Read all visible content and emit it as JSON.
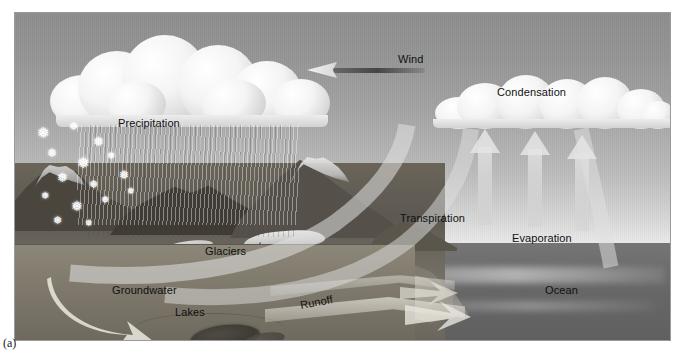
{
  "figure": {
    "caption": "(a)",
    "type": "science-diagram"
  },
  "scene": {
    "sky_color": "#a3a3a3",
    "ocean_color": "#6a6a6a",
    "land_color": "#6e6a60",
    "underground_color": "#837e70"
  },
  "labels": {
    "wind": "Wind",
    "precipitation": "Precipitation",
    "condensation": "Condensation",
    "transpiration": "Transpiration",
    "evaporation": "Evaporation",
    "ocean": "Ocean",
    "glaciers": "Glaciers",
    "groundwater": "Groundwater",
    "lakes": "Lakes",
    "runoff": "Runoff"
  },
  "elements": {
    "precipitation_cloud": "cumulus-cloud-with-rain",
    "condensation_cloud": "cumulus-cloud",
    "rain_streaks": "rain-fall",
    "snowflakes": "snow-fall",
    "wind_arrow_direction": "left",
    "evaporation_arrows_count": 3,
    "evaporation_arrow_direction": "up",
    "groundwater_arrow_direction": "down-left",
    "mountains": "mountain-range",
    "glacier_mass": "glacier",
    "lake_bodies": "lakes",
    "runoff_channel": "river-runoff"
  }
}
